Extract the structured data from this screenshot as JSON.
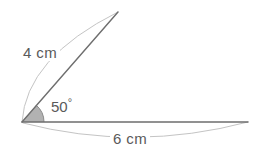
{
  "diagram": {
    "background_color": "#ffffff",
    "stroke_color": "#6e6e6e",
    "thin_stroke_color": "#c0c0c0",
    "sector_fill_color": "#b2b2b2",
    "text_color": "#5a5a5a",
    "vertex": {
      "x": 22,
      "y": 122
    },
    "rays": [
      {
        "name": "horizontal-ray",
        "from": {
          "x": 22,
          "y": 122
        },
        "to": {
          "x": 248,
          "y": 122
        },
        "length_label": "6 cm"
      },
      {
        "name": "slant-ray",
        "from": {
          "x": 22,
          "y": 122
        },
        "to": {
          "x": 118,
          "y": 12
        },
        "length_label": "4 cm"
      }
    ],
    "angle": {
      "value": 50,
      "unit": "degrees",
      "label_number": "50",
      "label_symbol": "°",
      "sector_radius": 22
    },
    "labels": {
      "side_a": "4 cm",
      "side_b": "6 cm",
      "angle_number": "50",
      "angle_degree": "°"
    },
    "dimension_arcs": [
      {
        "name": "arc-4cm",
        "for_side": "4 cm",
        "bows": "left"
      },
      {
        "name": "arc-6cm",
        "for_side": "6 cm",
        "bows": "down"
      }
    ]
  }
}
